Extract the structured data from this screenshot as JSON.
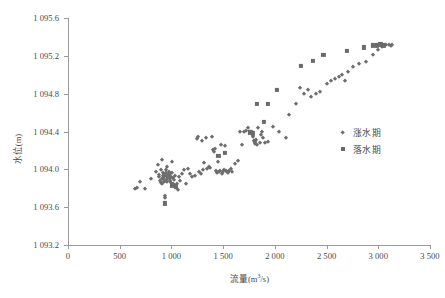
{
  "chart_data": {
    "type": "scatter",
    "title": "",
    "xlabel": "流量(m³/s)",
    "ylabel": "水位(m)",
    "xlim": [
      0,
      3500
    ],
    "ylim": [
      1093.2,
      1095.6
    ],
    "xticks": [
      0,
      500,
      1000,
      1500,
      2000,
      2500,
      3000,
      3500
    ],
    "yticks": [
      1093.2,
      1093.6,
      1094.0,
      1094.4,
      1094.8,
      1095.2,
      1095.6
    ],
    "xticklabels": [
      "0",
      "500",
      "1 000",
      "1 500",
      "2 000",
      "2 500",
      "3 000",
      "3 500"
    ],
    "yticklabels": [
      "1 093.2",
      "1 093.6",
      "1 094.0",
      "1 094.4",
      "1 094.8",
      "1 095.2",
      "1 095.6"
    ],
    "grid": false,
    "legend_position": "right-center",
    "marker_color": "#6d6d6d",
    "axis_color": "#9a9a9a",
    "series": [
      {
        "name": "涨水期",
        "marker": "diamond",
        "color": "#6d6d6d",
        "points": [
          [
            645,
            1093.79
          ],
          [
            668,
            1093.8
          ],
          [
            700,
            1093.87
          ],
          [
            742,
            1093.79
          ],
          [
            800,
            1093.9
          ],
          [
            852,
            1093.97
          ],
          [
            868,
            1094.05
          ],
          [
            876,
            1093.94
          ],
          [
            880,
            1093.92
          ],
          [
            890,
            1093.88
          ],
          [
            895,
            1093.86
          ],
          [
            900,
            1093.99
          ],
          [
            905,
            1094.1
          ],
          [
            908,
            1093.9
          ],
          [
            912,
            1093.84
          ],
          [
            915,
            1093.96
          ],
          [
            918,
            1093.93
          ],
          [
            920,
            1093.9
          ],
          [
            925,
            1093.87
          ],
          [
            928,
            1093.95
          ],
          [
            932,
            1093.92
          ],
          [
            935,
            1093.88
          ],
          [
            938,
            1093.7
          ],
          [
            940,
            1093.72
          ],
          [
            944,
            1093.99
          ],
          [
            948,
            1093.96
          ],
          [
            952,
            1093.93
          ],
          [
            955,
            1093.9
          ],
          [
            958,
            1093.87
          ],
          [
            962,
            1094.02
          ],
          [
            966,
            1093.94
          ],
          [
            970,
            1093.91
          ],
          [
            974,
            1093.97
          ],
          [
            978,
            1093.93
          ],
          [
            982,
            1093.9
          ],
          [
            986,
            1093.95
          ],
          [
            990,
            1093.88
          ],
          [
            995,
            1093.92
          ],
          [
            1000,
            1093.86
          ],
          [
            1005,
            1093.96
          ],
          [
            1010,
            1094.08
          ],
          [
            1015,
            1093.91
          ],
          [
            1020,
            1093.84
          ],
          [
            1028,
            1093.89
          ],
          [
            1035,
            1093.93
          ],
          [
            1042,
            1093.8
          ],
          [
            1050,
            1093.85
          ],
          [
            1060,
            1093.78
          ],
          [
            1070,
            1093.92
          ],
          [
            1085,
            1093.88
          ],
          [
            1100,
            1093.95
          ],
          [
            1120,
            1093.99
          ],
          [
            1140,
            1093.85
          ],
          [
            1160,
            1094.0
          ],
          [
            1180,
            1093.95
          ],
          [
            1200,
            1093.92
          ],
          [
            1225,
            1093.93
          ],
          [
            1250,
            1094.32
          ],
          [
            1255,
            1094.34
          ],
          [
            1270,
            1093.97
          ],
          [
            1285,
            1093.95
          ],
          [
            1300,
            1094.3
          ],
          [
            1305,
            1093.99
          ],
          [
            1315,
            1094.07
          ],
          [
            1330,
            1094.33
          ],
          [
            1345,
            1094.0
          ],
          [
            1360,
            1094.02
          ],
          [
            1375,
            1094.01
          ],
          [
            1390,
            1094.34
          ],
          [
            1400,
            1094.2
          ],
          [
            1410,
            1094.18
          ],
          [
            1420,
            1094.21
          ],
          [
            1430,
            1093.98
          ],
          [
            1440,
            1093.96
          ],
          [
            1450,
            1094.08
          ],
          [
            1460,
            1093.97
          ],
          [
            1470,
            1093.98
          ],
          [
            1480,
            1094.26
          ],
          [
            1490,
            1093.95
          ],
          [
            1500,
            1093.97
          ],
          [
            1510,
            1093.99
          ],
          [
            1520,
            1094.25
          ],
          [
            1530,
            1093.98
          ],
          [
            1540,
            1093.97
          ],
          [
            1550,
            1093.96
          ],
          [
            1560,
            1093.98
          ],
          [
            1575,
            1094.0
          ],
          [
            1590,
            1093.97
          ],
          [
            1615,
            1094.06
          ],
          [
            1640,
            1094.09
          ],
          [
            1660,
            1094.4
          ],
          [
            1680,
            1094.26
          ],
          [
            1700,
            1094.39
          ],
          [
            1720,
            1094.41
          ],
          [
            1740,
            1094.44
          ],
          [
            1755,
            1094.39
          ],
          [
            1765,
            1094.38
          ],
          [
            1775,
            1094.4
          ],
          [
            1785,
            1094.34
          ],
          [
            1795,
            1094.3
          ],
          [
            1805,
            1094.27
          ],
          [
            1815,
            1094.31
          ],
          [
            1825,
            1094.26
          ],
          [
            1840,
            1094.44
          ],
          [
            1855,
            1094.28
          ],
          [
            1870,
            1094.36
          ],
          [
            1880,
            1094.4
          ],
          [
            1890,
            1094.33
          ],
          [
            1900,
            1094.28
          ],
          [
            1935,
            1094.29
          ],
          [
            1985,
            1094.45
          ],
          [
            2040,
            1094.4
          ],
          [
            2110,
            1094.33
          ],
          [
            2135,
            1094.57
          ],
          [
            2200,
            1094.69
          ],
          [
            2245,
            1094.86
          ],
          [
            2280,
            1094.8
          ],
          [
            2320,
            1094.84
          ],
          [
            2350,
            1094.76
          ],
          [
            2395,
            1094.8
          ],
          [
            2440,
            1094.82
          ],
          [
            2500,
            1094.9
          ],
          [
            2540,
            1094.93
          ],
          [
            2580,
            1094.95
          ],
          [
            2620,
            1094.98
          ],
          [
            2650,
            1095.0
          ],
          [
            2680,
            1094.93
          ],
          [
            2710,
            1095.03
          ],
          [
            2760,
            1095.08
          ],
          [
            2810,
            1095.11
          ],
          [
            2880,
            1095.14
          ],
          [
            2950,
            1095.21
          ],
          [
            3000,
            1095.26
          ],
          [
            3040,
            1095.29
          ],
          [
            3075,
            1095.31
          ],
          [
            3100,
            1095.31
          ],
          [
            3120,
            1095.3
          ],
          [
            3135,
            1095.31
          ]
        ]
      },
      {
        "name": "落水期",
        "marker": "square",
        "color": "#6a6a6a",
        "points": [
          [
            935,
            1093.64
          ],
          [
            1010,
            1093.83
          ],
          [
            1040,
            1093.82
          ],
          [
            1455,
            1094.14
          ],
          [
            1520,
            1094.17
          ],
          [
            1760,
            1094.39
          ],
          [
            1790,
            1094.38
          ],
          [
            1810,
            1094.3
          ],
          [
            1830,
            1094.69
          ],
          [
            1895,
            1094.5
          ],
          [
            1930,
            1094.69
          ],
          [
            2020,
            1094.84
          ],
          [
            2250,
            1095.09
          ],
          [
            2370,
            1095.15
          ],
          [
            2470,
            1095.21
          ],
          [
            2700,
            1095.25
          ],
          [
            2860,
            1095.29
          ],
          [
            2950,
            1095.31
          ],
          [
            2985,
            1095.31
          ],
          [
            3020,
            1095.32
          ],
          [
            3050,
            1095.31
          ]
        ]
      }
    ]
  }
}
